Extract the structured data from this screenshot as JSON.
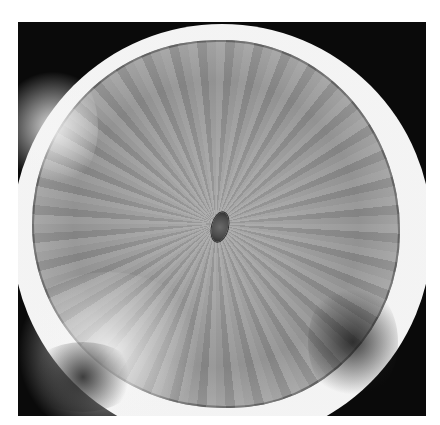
{
  "image": {
    "description": "Grayscale photograph of a roughly circular specimen with radial streak texture, a small dark oval center, bright outer halo on a black square background",
    "colors": {
      "page_background": "#ffffff",
      "frame_background": "#0a0a0a",
      "halo": "#f2f2f2",
      "disk_mid": "#9c9c9c",
      "center_spot": "#4a4a4a"
    }
  }
}
